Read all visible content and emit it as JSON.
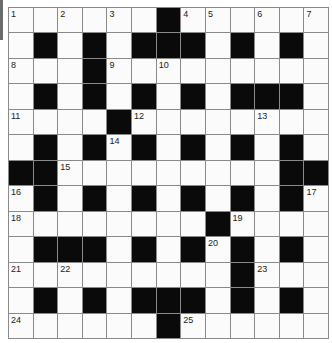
{
  "puzzle": {
    "rows": 13,
    "cols": 13,
    "colors": {
      "block": "#0a0a0a",
      "cell": "#fbfbfb",
      "line": "#8a8a8a",
      "side_tab": "#6b6b6b"
    },
    "layout": [
      "WWWWWWBWWWWWW",
      "WBWBWBBBWBWBW",
      "WWWBWWWWWWWWW",
      "WBWBWBWBWBBBW",
      "WWWWBWWWWWWWW",
      "WBWBWBWBWBWBW",
      "BBWWWWWWWWWBB",
      "WBWBWBWBWBWBW",
      "WWWWWWWWBWWWW",
      "WBBBWBWBWBWBW",
      "WWWWWWWWWBWWW",
      "WBWBWBBBWBWBW",
      "WWWWWWBWWWWWW"
    ],
    "numbers": [
      {
        "n": "1",
        "r": 0,
        "c": 0
      },
      {
        "n": "2",
        "r": 0,
        "c": 2
      },
      {
        "n": "3",
        "r": 0,
        "c": 4
      },
      {
        "n": "4",
        "r": 0,
        "c": 7
      },
      {
        "n": "5",
        "r": 0,
        "c": 8
      },
      {
        "n": "6",
        "r": 0,
        "c": 10
      },
      {
        "n": "7",
        "r": 0,
        "c": 12
      },
      {
        "n": "8",
        "r": 2,
        "c": 0
      },
      {
        "n": "9",
        "r": 2,
        "c": 4
      },
      {
        "n": "10",
        "r": 2,
        "c": 6
      },
      {
        "n": "11",
        "r": 4,
        "c": 0
      },
      {
        "n": "12",
        "r": 4,
        "c": 5
      },
      {
        "n": "13",
        "r": 4,
        "c": 10
      },
      {
        "n": "14",
        "r": 5,
        "c": 4
      },
      {
        "n": "15",
        "r": 6,
        "c": 2
      },
      {
        "n": "16",
        "r": 7,
        "c": 0
      },
      {
        "n": "17",
        "r": 7,
        "c": 12
      },
      {
        "n": "18",
        "r": 8,
        "c": 0
      },
      {
        "n": "19",
        "r": 8,
        "c": 9
      },
      {
        "n": "20",
        "r": 9,
        "c": 8
      },
      {
        "n": "21",
        "r": 10,
        "c": 0
      },
      {
        "n": "22",
        "r": 10,
        "c": 2
      },
      {
        "n": "23",
        "r": 10,
        "c": 10
      },
      {
        "n": "24",
        "r": 12,
        "c": 0
      },
      {
        "n": "25",
        "r": 12,
        "c": 7
      }
    ]
  }
}
